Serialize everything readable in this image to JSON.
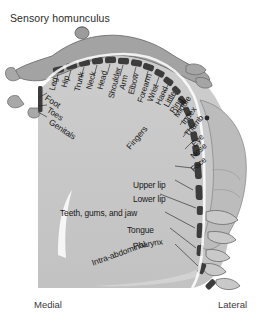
{
  "figure": {
    "title": "Sensory homunculus",
    "orientation": {
      "left_label": "Medial",
      "right_label": "Lateral"
    },
    "colors": {
      "background": "#ffffff",
      "cortex_fill": "#c6c6c6",
      "cortex_fill_light": "#d2d2d2",
      "segment_dark": "#3a3a3a",
      "outline": "#4a4a4a",
      "body_figure": "#9a9a9a",
      "sulcus_white": "#f4f4f4",
      "text": "#181818"
    },
    "cortical_map_labels": [
      {
        "id": "genitals",
        "text": "Genitals",
        "angle": 38
      },
      {
        "id": "toes",
        "text": "Toes",
        "angle": 30
      },
      {
        "id": "foot",
        "text": "Foot",
        "angle": 28
      },
      {
        "id": "leg",
        "text": "Leg",
        "angle": -78
      },
      {
        "id": "hip",
        "text": "Hip",
        "angle": -78
      },
      {
        "id": "trunk",
        "text": "Trunk",
        "angle": -78
      },
      {
        "id": "neck",
        "text": "Neck",
        "angle": -78
      },
      {
        "id": "head",
        "text": "Head",
        "angle": -78
      },
      {
        "id": "shoulder",
        "text": "Shoulder",
        "angle": -78
      },
      {
        "id": "arm",
        "text": "Arm",
        "angle": -78
      },
      {
        "id": "elbow",
        "text": "Elbow",
        "angle": -78
      },
      {
        "id": "forearm",
        "text": "Forearm",
        "angle": -74
      },
      {
        "id": "wrist",
        "text": "Wrist",
        "angle": -72
      },
      {
        "id": "hand",
        "text": "Hand",
        "angle": -70
      },
      {
        "id": "little",
        "text": "Little",
        "angle": -65
      },
      {
        "id": "ring",
        "text": "Ring",
        "angle": -60
      },
      {
        "id": "middle",
        "text": "Middle",
        "angle": -58
      },
      {
        "id": "index",
        "text": "Index",
        "angle": -55
      },
      {
        "id": "thumb",
        "text": "Thumb",
        "angle": -52
      },
      {
        "id": "eye",
        "text": "Eye",
        "angle": -48
      },
      {
        "id": "nose",
        "text": "Nose",
        "angle": -45
      },
      {
        "id": "face",
        "text": "Face",
        "angle": -42
      },
      {
        "id": "fingers",
        "text": "Fingers",
        "angle": -52
      },
      {
        "id": "upper-lip",
        "text": "Upper lip",
        "angle": 0
      },
      {
        "id": "lower-lip",
        "text": "Lower lip",
        "angle": 0
      },
      {
        "id": "teeth-gums-jaw",
        "text": "Teeth, gums, and jaw",
        "angle": 0
      },
      {
        "id": "tongue",
        "text": "Tongue",
        "angle": 0
      },
      {
        "id": "pharynx",
        "text": "Pharynx",
        "angle": -10
      },
      {
        "id": "intra-abdominal",
        "text": "Intra-abdominal",
        "angle": -22
      }
    ]
  }
}
